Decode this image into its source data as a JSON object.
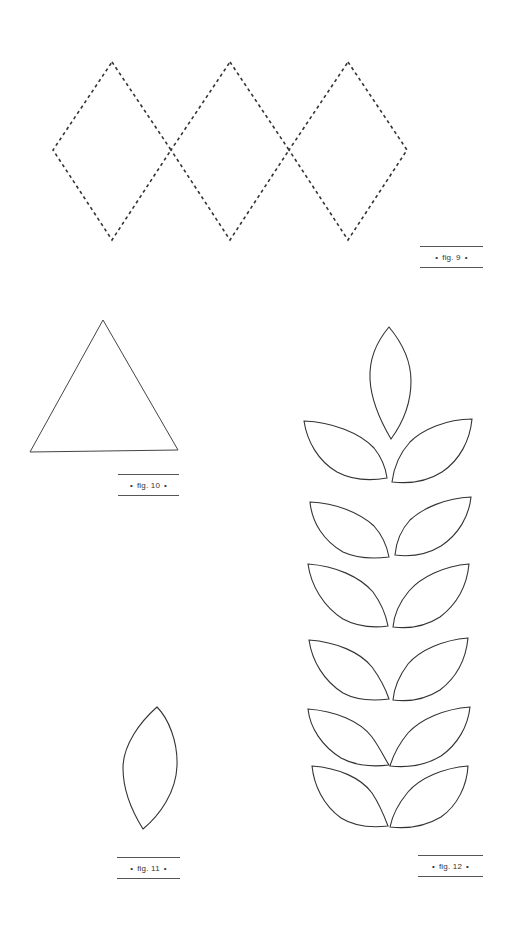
{
  "page": {
    "background": "#ffffff",
    "stroke_color": "#333333"
  },
  "figures": [
    {
      "id": "fig9",
      "caption": "fig. 9",
      "description": "Three adjoining dashed diamonds in a row",
      "shape": "dashed-diamond-row",
      "count": 3
    },
    {
      "id": "fig10",
      "caption": "fig. 10",
      "description": "Outlined equilateral triangle",
      "shape": "triangle"
    },
    {
      "id": "fig11",
      "caption": "fig. 11",
      "description": "Single outlined leaf / petal shape",
      "shape": "leaf"
    },
    {
      "id": "fig12",
      "caption": "fig. 12",
      "description": "Fern branch: one top leaf and six pairs of side leaves",
      "shape": "leaf-branch",
      "leaf_pairs": 6
    }
  ],
  "bullet": "•"
}
